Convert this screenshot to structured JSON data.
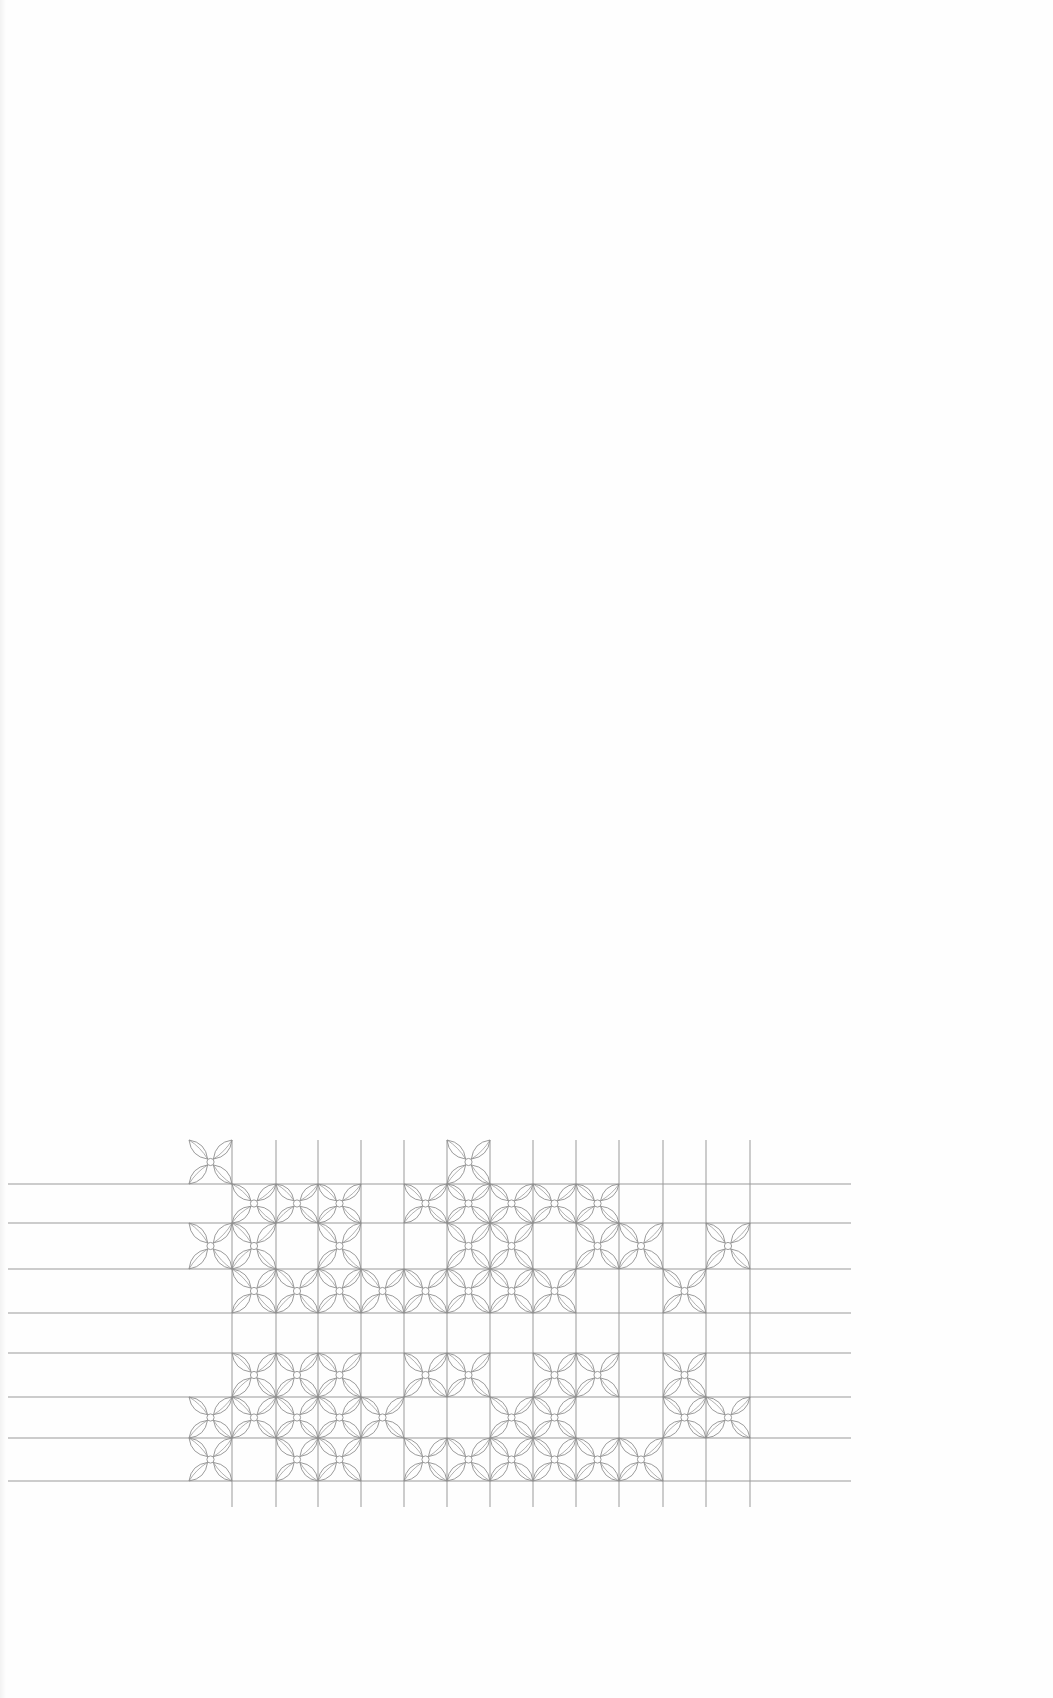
{
  "page": {
    "background": "#fefefe",
    "line_color": "#9a9a9a",
    "motif_color": "#8f8f8f"
  },
  "pattern": {
    "title": "",
    "motif": "four-petal-flower",
    "col_lines_x": [
      232,
      276,
      318,
      361,
      404,
      447,
      490,
      533,
      576,
      619,
      663,
      706,
      750
    ],
    "col_left_edge": 189,
    "row_lines_y": [
      1184,
      1223,
      1269,
      1313,
      1353,
      1397,
      1438,
      1481
    ],
    "row_top_edge": 1140,
    "vertical_lines_top": 1140,
    "vertical_lines_bottom": 1507,
    "horizontal_lines_left": 8,
    "horizontal_lines_right": 851,
    "filled_cells": [
      [
        0,
        6
      ],
      [
        1,
        2,
        3,
        5,
        6,
        7,
        8,
        9
      ],
      [
        0,
        1,
        3,
        6,
        7,
        9,
        10,
        12
      ],
      [
        1,
        2,
        3,
        4,
        5,
        6,
        7,
        8,
        11
      ],
      [],
      [
        1,
        2,
        3,
        5,
        6,
        8,
        9,
        11
      ],
      [
        0,
        1,
        2,
        3,
        4,
        7,
        8,
        11,
        12
      ],
      [
        0,
        2,
        3,
        5,
        6,
        7,
        8,
        9,
        10
      ]
    ]
  }
}
